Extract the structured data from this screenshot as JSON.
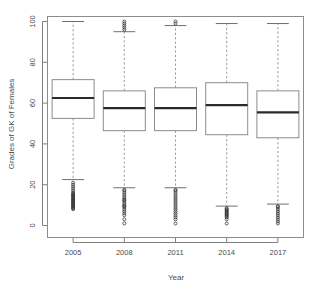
{
  "chart_data": {
    "type": "box",
    "title": "",
    "xlabel": "Year",
    "ylabel": "Grades of GK of Females",
    "categories": [
      "2005",
      "2008",
      "2011",
      "2014",
      "2017"
    ],
    "ylim": [
      0,
      100
    ],
    "yticks": [
      0,
      20,
      40,
      60,
      80,
      100
    ],
    "ytick_labels": [
      "0",
      "20",
      "40",
      "60",
      "80",
      "100"
    ],
    "grid": false,
    "legend": "none",
    "boxes": [
      {
        "category": "2005",
        "whisker_low": 22.5,
        "q1": 52.5,
        "median": 62.5,
        "q3": 71.5,
        "whisker_high": 100,
        "outliers_low": [
          21,
          20,
          19,
          18,
          17,
          16,
          15.5,
          15,
          14.5,
          14,
          13.5,
          13,
          12.5,
          12,
          11.5,
          11,
          10.5,
          10,
          9.5,
          9,
          8.5,
          8
        ],
        "outliers_high": []
      },
      {
        "category": "2008",
        "whisker_low": 18.5,
        "q1": 46.5,
        "median": 57.5,
        "q3": 66,
        "whisker_high": 95,
        "outliers_low": [
          17.5,
          17,
          16,
          15,
          14,
          13,
          12.5,
          12,
          11,
          10,
          9.5,
          9,
          8,
          7,
          6,
          5,
          3,
          1
        ],
        "outliers_high": [
          96,
          97,
          98,
          99,
          100
        ]
      },
      {
        "category": "2011",
        "whisker_low": 18.5,
        "q1": 46.5,
        "median": 57.5,
        "q3": 67.5,
        "whisker_high": 98,
        "outliers_low": [
          17.5,
          17,
          16,
          15,
          14,
          13,
          12,
          11,
          10,
          9,
          8,
          7,
          6,
          5,
          4,
          3,
          1
        ],
        "outliers_high": [
          99,
          100
        ]
      },
      {
        "category": "2014",
        "whisker_low": 9.5,
        "q1": 44.5,
        "median": 59,
        "q3": 70,
        "whisker_high": 99,
        "outliers_low": [
          8.5,
          8,
          7.5,
          7,
          6.5,
          6,
          5.5,
          5,
          4.5,
          4,
          3,
          1
        ],
        "outliers_high": []
      },
      {
        "category": "2017",
        "whisker_low": 10.5,
        "q1": 43,
        "median": 55.5,
        "q3": 66,
        "whisker_high": 99,
        "outliers_low": [
          9.5,
          9,
          8,
          7,
          6,
          5,
          4,
          3,
          2,
          1
        ],
        "outliers_high": []
      }
    ]
  }
}
